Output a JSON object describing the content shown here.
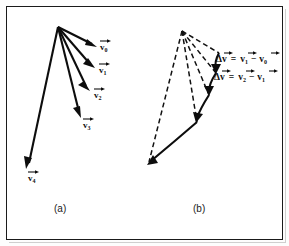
{
  "figure": {
    "type": "vector-diagram",
    "background_color": "#ffffff",
    "ink_color": "#0d0d0d",
    "panels": [
      {
        "id": "a",
        "caption": "(a)",
        "description": "Fan of velocity vectors from common origin",
        "origin": {
          "x": 58,
          "y": 27
        },
        "vectors": [
          {
            "name": "v0",
            "label": "v",
            "subscript": "0",
            "tip": {
              "x": 97,
              "y": 47
            },
            "label_pos": {
              "x": 100,
              "y": 50
            },
            "style": "solid"
          },
          {
            "name": "v1",
            "label": "v",
            "subscript": "1",
            "tip": {
              "x": 95,
              "y": 68
            },
            "label_pos": {
              "x": 99,
              "y": 73
            },
            "style": "solid"
          },
          {
            "name": "v2",
            "label": "v",
            "subscript": "2",
            "tip": {
              "x": 90,
              "y": 91
            },
            "label_pos": {
              "x": 94,
              "y": 98
            },
            "style": "solid"
          },
          {
            "name": "v3",
            "label": "v",
            "subscript": "3",
            "tip": {
              "x": 81,
              "y": 118
            },
            "label_pos": {
              "x": 83,
              "y": 128
            },
            "style": "solid"
          },
          {
            "name": "v4",
            "label": "v",
            "subscript": "4",
            "tip": {
              "x": 26,
              "y": 169
            },
            "label_pos": {
              "x": 28,
              "y": 181
            },
            "style": "solid"
          }
        ]
      },
      {
        "id": "b",
        "caption": "(b)",
        "description": "Same velocity vectors drawn dashed with solid delta-v difference arrows joining their tips",
        "origin": {
          "x": 182,
          "y": 31
        },
        "dashed_vectors": [
          {
            "name": "v0-dashed",
            "tip": {
              "x": 219,
              "y": 53
            }
          },
          {
            "name": "v1-dashed",
            "tip": {
              "x": 216,
              "y": 73
            }
          },
          {
            "name": "v2-dashed",
            "tip": {
              "x": 209,
              "y": 95
            }
          },
          {
            "name": "v3-dashed",
            "tip": {
              "x": 197,
              "y": 122
            }
          },
          {
            "name": "v4-dashed",
            "tip": {
              "x": 147,
              "y": 166
            }
          }
        ],
        "delta_arrows": [
          {
            "name": "delta-v-0-1",
            "from": {
              "x": 219,
              "y": 53
            },
            "to": {
              "x": 216,
              "y": 73
            }
          },
          {
            "name": "delta-v-1-2",
            "from": {
              "x": 216,
              "y": 73
            },
            "to": {
              "x": 209,
              "y": 95
            }
          },
          {
            "name": "delta-v-2-3",
            "from": {
              "x": 209,
              "y": 95
            },
            "to": {
              "x": 197,
              "y": 122
            }
          },
          {
            "name": "delta-v-3-4",
            "from": {
              "x": 197,
              "y": 122
            },
            "to": {
              "x": 147,
              "y": 166
            }
          }
        ],
        "equations": [
          {
            "name": "equation-delta-v-first",
            "parts": [
              "Δ",
              "v",
              "=",
              "v",
              "1",
              "−",
              "v",
              "0"
            ],
            "plain": "Δv = v1 − v0",
            "pos": {
              "x": 216,
              "y": 62
            }
          },
          {
            "name": "equation-delta-v-second",
            "parts": [
              "Δ",
              "v",
              "=",
              "v",
              "2",
              "−",
              "v",
              "1"
            ],
            "plain": "Δv = v2 − v1",
            "pos": {
              "x": 214,
              "y": 80
            }
          }
        ]
      }
    ],
    "captions": {
      "panel_a": "(a)",
      "panel_b": "(b)"
    }
  }
}
